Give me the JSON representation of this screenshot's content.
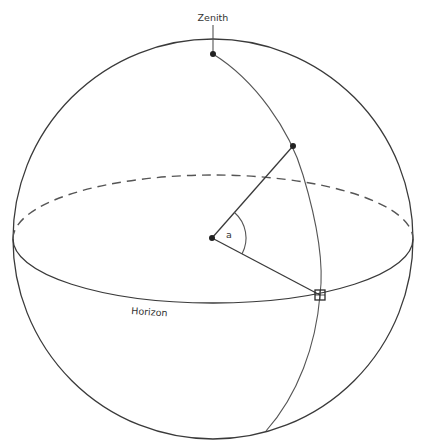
{
  "diagram": {
    "type": "celestial-sphere",
    "labels": {
      "zenith": "Zenith",
      "horizon": "Horizon",
      "angle": "a"
    },
    "colors": {
      "line": "#3a3a3a",
      "dashed": "#555555",
      "background": "#ffffff"
    },
    "geometry": {
      "sphere": {
        "cx": 213,
        "cy": 239,
        "r": 200
      },
      "horizon_ellipse": {
        "cx": 213,
        "cy": 239,
        "rx": 200,
        "ry": 64
      },
      "center_point": {
        "x": 212,
        "y": 238
      },
      "zenith_point": {
        "x": 213,
        "y": 54
      },
      "star_point": {
        "x": 293,
        "y": 146
      },
      "horizon_point": {
        "x": 320,
        "y": 295
      },
      "meridian_bottom": {
        "x": 266,
        "y": 431
      }
    }
  }
}
